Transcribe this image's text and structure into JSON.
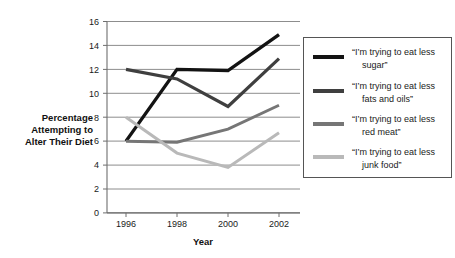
{
  "chart_data": {
    "type": "line",
    "title": "",
    "xlabel": "Year",
    "ylabel": "Percentage Attempting to Alter Their Diet",
    "ylabel_lines": [
      "Percentage",
      "Attempting to",
      "Alter Their Diet"
    ],
    "x": [
      1996,
      1998,
      2000,
      2002
    ],
    "categories": [
      "1996",
      "1998",
      "2000",
      "2002"
    ],
    "xlim": [
      1995.3,
      2002.6
    ],
    "ylim": [
      0,
      16
    ],
    "yticks": [
      0,
      2,
      4,
      6,
      8,
      10,
      12,
      14,
      16
    ],
    "ytick_labels": [
      "0",
      "2",
      "4",
      "6",
      "8",
      "10",
      "12",
      "14",
      "16"
    ],
    "grid": true,
    "legend_position": "right",
    "series": [
      {
        "name": "“I’m trying to eat less sugar”",
        "label_lines": [
          "“I’m trying to eat less",
          "sugar”"
        ],
        "color": "#131313",
        "values": [
          6.0,
          12.0,
          11.9,
          14.9
        ]
      },
      {
        "name": "“I’m trying to eat less fats and oils”",
        "label_lines": [
          "“I’m trying to eat less",
          "fats and oils”"
        ],
        "color": "#3f3f3f",
        "values": [
          12.0,
          11.2,
          8.9,
          12.9
        ]
      },
      {
        "name": "“I’m trying to eat less red meat”",
        "label_lines": [
          "“I’m trying to eat less",
          "red meat”"
        ],
        "color": "#767676",
        "values": [
          6.0,
          5.9,
          7.0,
          9.0
        ]
      },
      {
        "name": "“I’m trying to eat less junk food”",
        "label_lines": [
          "“I’m trying to eat less",
          "junk food”"
        ],
        "color": "#b9b9b9",
        "values": [
          8.0,
          5.0,
          3.8,
          6.7
        ]
      }
    ]
  }
}
